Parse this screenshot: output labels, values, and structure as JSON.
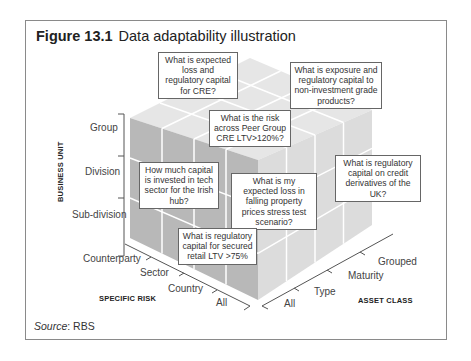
{
  "figure": {
    "label": "Figure 13.1",
    "title": "Data adaptability illustration"
  },
  "axes": {
    "business_unit": {
      "title": "BUSINESS UNIT",
      "levels": [
        "Group",
        "Division",
        "Sub-division"
      ]
    },
    "specific_risk": {
      "title": "SPECIFIC RISK",
      "levels": [
        "Counterparty",
        "Sector",
        "Country",
        "All"
      ]
    },
    "asset_class": {
      "title": "ASSET CLASS",
      "levels": [
        "Grouped",
        "Maturity",
        "Type",
        "All"
      ]
    }
  },
  "callouts": [
    "What is expected loss and regulatory capital for CRE?",
    "What is exposure and regulatory capital to non-investment grade products?",
    "What is the risk across Peer Group CRE LTV>120%?",
    "How much capital is invested in tech sector for the Irish hub?",
    "What is my expected loss in falling property prices stress test scenario?",
    "What is regulatory capital on credit derivatives of the UK?",
    "What is regulatory capital for secured retail LTV >75%"
  ],
  "source": {
    "label": "Source",
    "value": ": RBS"
  },
  "colors": {
    "top_face": "#e6e6e6",
    "left_face": "#b8b8b8",
    "right_face": "#dcdcdc",
    "grid": "#ffffff",
    "border": "#8a8a8a"
  }
}
